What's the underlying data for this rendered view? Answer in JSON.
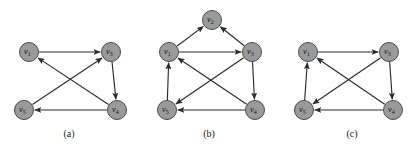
{
  "figure": {
    "background_color": "#ffffff",
    "node_fill_color": "#9a9a9a",
    "node_stroke_color": "#4a4a4a",
    "edge_color": "#2b2b2b",
    "label_color": "#111111",
    "node_radius": 9.5
  },
  "panels": [
    {
      "id": "a",
      "caption": "(a)",
      "caption_x": 69,
      "caption_y": 137,
      "nodes": [
        {
          "id": "v1",
          "name": "v",
          "sub": "1",
          "x": 29,
          "y": 52
        },
        {
          "id": "v3",
          "name": "v",
          "sub": "3",
          "x": 111,
          "y": 52
        },
        {
          "id": "v5",
          "name": "v",
          "sub": "5",
          "x": 24,
          "y": 110
        },
        {
          "id": "v4",
          "name": "v",
          "sub": "4",
          "x": 117,
          "y": 110
        }
      ],
      "edges": [
        {
          "from": "v1",
          "to": "v3",
          "label": "v1->v3"
        },
        {
          "from": "v3",
          "to": "v4",
          "label": "v3->v4"
        },
        {
          "from": "v4",
          "to": "v5",
          "label": "v4->v5"
        },
        {
          "from": "v5",
          "to": "v3",
          "label": "v5->v3"
        },
        {
          "from": "v4",
          "to": "v1",
          "label": "v4->v1"
        }
      ]
    },
    {
      "id": "b",
      "caption": "(b)",
      "caption_x": 209,
      "caption_y": 137,
      "nodes": [
        {
          "id": "v2",
          "name": "v",
          "sub": "2",
          "x": 212,
          "y": 20
        },
        {
          "id": "v1",
          "name": "v",
          "sub": "1",
          "x": 169,
          "y": 52
        },
        {
          "id": "v3",
          "name": "v",
          "sub": "3",
          "x": 252,
          "y": 52
        },
        {
          "id": "v5",
          "name": "v",
          "sub": "5",
          "x": 167,
          "y": 110
        },
        {
          "id": "v4",
          "name": "v",
          "sub": "4",
          "x": 255,
          "y": 110
        }
      ],
      "edges": [
        {
          "from": "v1",
          "to": "v2",
          "label": "v1->v2"
        },
        {
          "from": "v3",
          "to": "v2",
          "label": "v3->v2"
        },
        {
          "from": "v1",
          "to": "v3",
          "label": "v1->v3"
        },
        {
          "from": "v3",
          "to": "v4",
          "label": "v3->v4"
        },
        {
          "from": "v4",
          "to": "v5",
          "label": "v4->v5"
        },
        {
          "from": "v5",
          "to": "v1",
          "label": "v5->v1"
        },
        {
          "from": "v4",
          "to": "v1",
          "label": "v4->v1"
        },
        {
          "from": "v3",
          "to": "v5",
          "label": "v3->v5"
        }
      ]
    },
    {
      "id": "c",
      "caption": "(c)",
      "caption_x": 352,
      "caption_y": 137,
      "nodes": [
        {
          "id": "v1",
          "name": "v",
          "sub": "1",
          "x": 308,
          "y": 52
        },
        {
          "id": "v3",
          "name": "v",
          "sub": "3",
          "x": 389,
          "y": 52
        },
        {
          "id": "v5",
          "name": "v",
          "sub": "5",
          "x": 304,
          "y": 110
        },
        {
          "id": "v4",
          "name": "v",
          "sub": "4",
          "x": 393,
          "y": 110
        }
      ],
      "edges": [
        {
          "from": "v1",
          "to": "v3",
          "label": "v1->v3"
        },
        {
          "from": "v3",
          "to": "v4",
          "label": "v3->v4"
        },
        {
          "from": "v4",
          "to": "v5",
          "label": "v4->v5"
        },
        {
          "from": "v5",
          "to": "v1",
          "label": "v5->v1"
        },
        {
          "from": "v4",
          "to": "v1",
          "label": "v4->v1"
        },
        {
          "from": "v3",
          "to": "v5",
          "label": "v3->v5"
        }
      ]
    }
  ]
}
